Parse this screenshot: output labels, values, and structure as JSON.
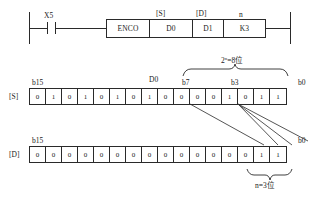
{
  "diagram": {
    "ladder": {
      "contact_label": "X5",
      "contact_type": "normally-open",
      "operand_headers": {
        "source": "[S]",
        "destination": "[D]",
        "count": "n"
      },
      "cells": [
        {
          "name": "instruction",
          "text": "ENCO"
        },
        {
          "name": "source-operand",
          "text": "D0"
        },
        {
          "name": "destination-operand",
          "text": "D1"
        },
        {
          "name": "n-operand",
          "text": "K3"
        }
      ]
    },
    "source_row": {
      "tag": "[S]",
      "register": "D0",
      "msb_label": "b15",
      "b7_label": "b7",
      "b3_label": "b3",
      "lsb_label": "b0",
      "brace_label": "2ⁿ=8位",
      "bits": [
        "0",
        "1",
        "0",
        "1",
        "0",
        "1",
        "0",
        "1",
        "0",
        "0",
        "0",
        "0",
        "1",
        "0",
        "1",
        "1"
      ]
    },
    "dest_row": {
      "tag": "[D]",
      "msb_label": "b15",
      "lsb_label": "b0",
      "brace_label": "n=3位",
      "bits": [
        "0",
        "0",
        "0",
        "0",
        "0",
        "0",
        "0",
        "0",
        "0",
        "0",
        "0",
        "0",
        "0",
        "0",
        "1",
        "1"
      ]
    },
    "colors": {
      "line": "#2a2a2a",
      "text": "#1a1a1a",
      "background": "#ffffff"
    }
  }
}
